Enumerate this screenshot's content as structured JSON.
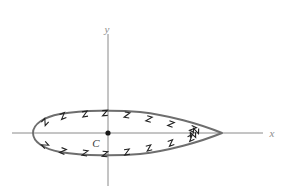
{
  "figure": {
    "background_color": "#ffffff",
    "width": 282,
    "height": 194
  },
  "axes": {
    "color": "#8a8a8a",
    "stroke_width": 1,
    "x_axis": {
      "label": "x",
      "label_x": 272,
      "label_y": 137,
      "x_start": 12,
      "x_end": 263,
      "y": 133
    },
    "y_axis": {
      "label": "y",
      "label_x": 107,
      "label_y": 33,
      "y_start": 34,
      "y_end": 186,
      "x": 108
    }
  },
  "origin": {
    "label": "C",
    "label_x": 96,
    "label_y": 147,
    "dot_x": 108,
    "dot_y": 133,
    "dot_radius": 2.6,
    "dot_color": "#1a1a1a",
    "label_color": "#3a3a3a"
  },
  "curve": {
    "name": "airfoil-outline",
    "stroke_color": "#6e6e6e",
    "stroke_width": 1.9,
    "fill": "none",
    "leading_edge_x": 33,
    "trailing_edge_x": 222,
    "chord_y": 133,
    "max_upper_y": 112,
    "max_lower_y": 155,
    "path": "M 222 133 C 200 124 168 115 140 112 C 118 110 84 110 60 114 C 44 117 33 124 33 133 C 33 142 44 149 60 152 C 84 156 118 156 140 154 C 168 151 200 142 222 133 Z"
  },
  "hatch_marks": {
    "name": "boundary-hatching",
    "color": "#222222",
    "stroke_width": 1.1,
    "count": 18,
    "description": "small z-shaped tick marks along the inner side of the airfoil boundary",
    "upper": [
      {
        "x": 45,
        "y": 122,
        "rot": -48
      },
      {
        "x": 63,
        "y": 116,
        "rot": -22
      },
      {
        "x": 85,
        "y": 114,
        "rot": -10
      },
      {
        "x": 105,
        "y": 113,
        "rot": -4
      },
      {
        "x": 127,
        "y": 115,
        "rot": 8
      },
      {
        "x": 149,
        "y": 119,
        "rot": 16
      },
      {
        "x": 171,
        "y": 124,
        "rot": 20
      },
      {
        "x": 193,
        "y": 129,
        "rot": 24
      },
      {
        "x": 193,
        "y": 135,
        "rot": 88
      }
    ],
    "lower": [
      {
        "x": 45,
        "y": 145,
        "rot": 48
      },
      {
        "x": 63,
        "y": 151,
        "rot": 22
      },
      {
        "x": 85,
        "y": 153,
        "rot": 10
      },
      {
        "x": 105,
        "y": 154,
        "rot": 4
      },
      {
        "x": 127,
        "y": 152,
        "rot": -8
      },
      {
        "x": 149,
        "y": 148,
        "rot": -16
      },
      {
        "x": 171,
        "y": 143,
        "rot": -20
      },
      {
        "x": 191,
        "y": 138,
        "rot": -24
      },
      {
        "x": 196,
        "y": 131,
        "rot": -88
      }
    ]
  }
}
